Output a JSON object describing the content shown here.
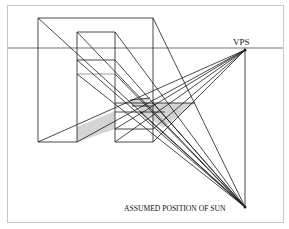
{
  "diagram": {
    "type": "perspective-shadow-construction",
    "labels": {
      "vanishing_point": "VPS",
      "sun": "ASSUMED POSITION OF SUN"
    },
    "colors": {
      "line": "#1a1a1a",
      "horizon": "#b8b8b8",
      "frame": "#c8c8c8",
      "shadow": "#d4d4d4"
    },
    "points": {
      "vps": [
        245,
        50
      ],
      "sun": [
        245,
        207
      ]
    },
    "horizon_y": 48
  }
}
